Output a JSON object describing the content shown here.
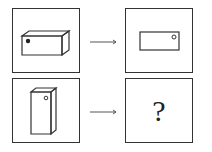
{
  "puzzle": {
    "question_mark": "?",
    "rows": [
      {
        "left": "horizontal-box-with-dot",
        "right": "front-view-rectangle-with-circle"
      },
      {
        "left": "vertical-box-with-circle",
        "right": "unknown"
      }
    ],
    "stroke_color": "#333333"
  }
}
